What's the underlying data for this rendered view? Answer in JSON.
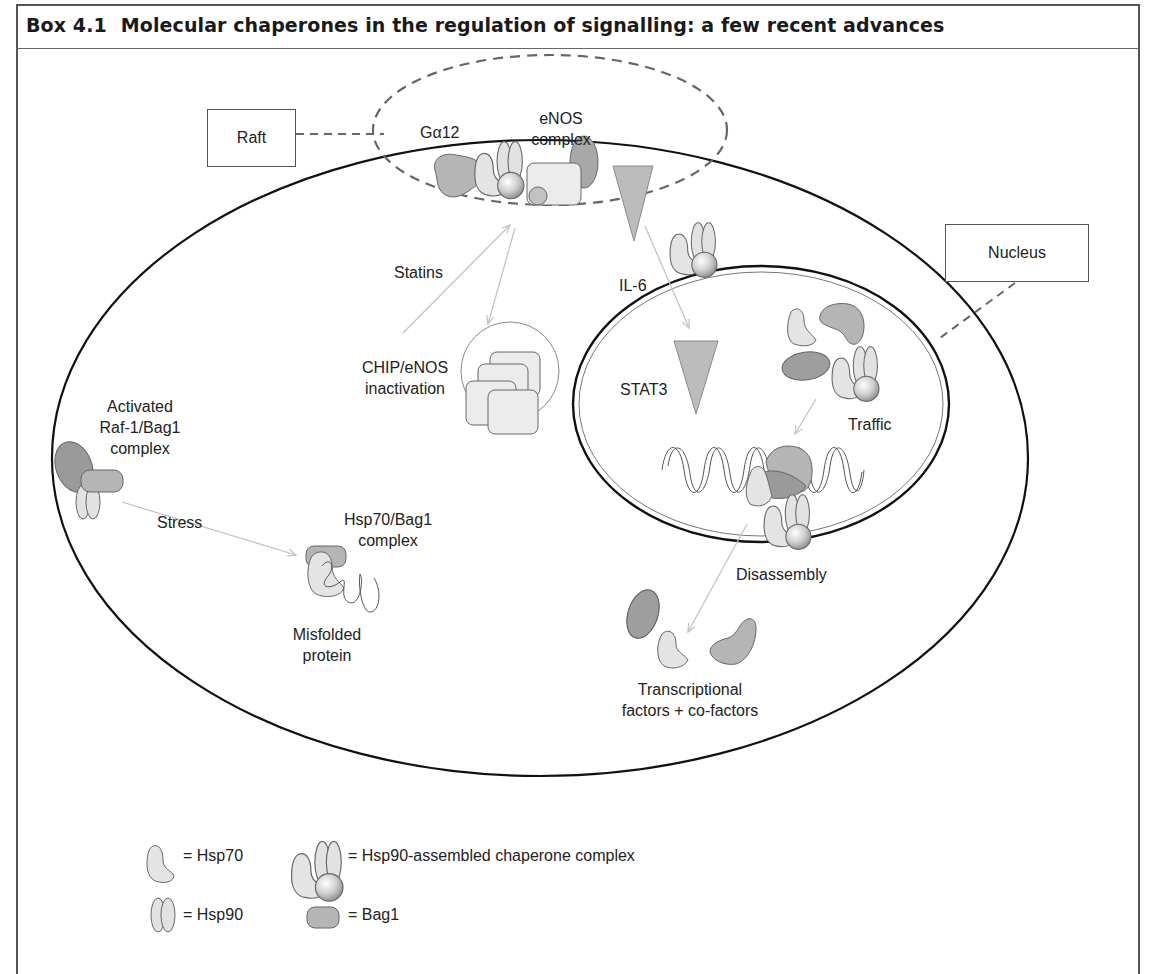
{
  "header": {
    "box_number": "Box 4.1",
    "title": "Molecular chaperones in the regulation of signalling: a few recent advances"
  },
  "callouts": {
    "raft": "Raft",
    "nucleus": "Nucleus"
  },
  "labels": {
    "galpha12": "Gα12",
    "enos_complex_line1": "eNOS",
    "enos_complex_line2": "complex",
    "statins": "Statins",
    "il6": "IL-6",
    "chip_line1": "CHIP/eNOS",
    "chip_line2": "inactivation",
    "stat3": "STAT3",
    "traffic": "Traffic",
    "raf_line1": "Activated",
    "raf_line2": "Raf-1/Bag1",
    "raf_line3": "complex",
    "stress": "Stress",
    "hsp70bag1_line1": "Hsp70/Bag1",
    "hsp70bag1_line2": "complex",
    "misfolded_line1": "Misfolded",
    "misfolded_line2": "protein",
    "disassembly": "Disassembly",
    "tf_line1": "Transcriptional",
    "tf_line2": "factors + co-factors"
  },
  "legend": [
    {
      "icon": "hsp70-icon",
      "label": "= Hsp70"
    },
    {
      "icon": "hsp90-complex-icon",
      "label": "= Hsp90-assembled chaperone complex"
    },
    {
      "icon": "hsp90-icon",
      "label": "= Hsp90"
    },
    {
      "icon": "bag1-icon",
      "label": "= Bag1"
    }
  ],
  "colors": {
    "light_protein": "#e4e4e4",
    "mid_protein": "#b9b9b9",
    "dark_protein": "#9a9a9a",
    "outline": "#555555",
    "arrow": "#c4c4c4",
    "dashed": "#666666"
  }
}
